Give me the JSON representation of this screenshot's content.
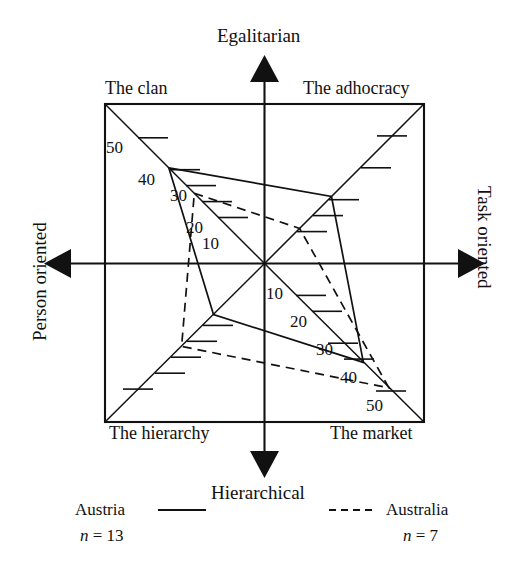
{
  "chart_data": {
    "type": "line",
    "title": "",
    "subtitle": "",
    "grid": false,
    "legend_position": "bottom",
    "axes": {
      "vertical": {
        "top_label": "Egalitarian",
        "bottom_label": "Hierarchical"
      },
      "horizontal": {
        "left_label": "Person oriented",
        "right_label": "Task oriented"
      }
    },
    "quadrants": [
      {
        "key": "clan",
        "label": "The clan",
        "corner": "top-left"
      },
      {
        "key": "adhocracy",
        "label": "The adhocracy",
        "corner": "top-right"
      },
      {
        "key": "hierarchy",
        "label": "The hierarchy",
        "corner": "bottom-left"
      },
      {
        "key": "market",
        "label": "The market",
        "corner": "bottom-right"
      }
    ],
    "scales": [
      {
        "key": "clan",
        "ticks": [
          10,
          20,
          30,
          40,
          50
        ],
        "tick_labels": [
          "10",
          "20",
          "30",
          "40",
          "50"
        ],
        "labeled": true
      },
      {
        "key": "adhocracy",
        "ticks": [
          10,
          20,
          30,
          40,
          50
        ],
        "tick_labels": [
          "",
          "",
          "",
          "",
          ""
        ],
        "labeled": false
      },
      {
        "key": "hierarchy",
        "ticks": [
          10,
          20,
          30,
          40,
          50
        ],
        "tick_labels": [
          "",
          "",
          "",
          "",
          ""
        ],
        "labeled": false
      },
      {
        "key": "market",
        "ticks": [
          10,
          20,
          30,
          40,
          50
        ],
        "tick_labels": [
          "10",
          "20",
          "30",
          "40",
          "50"
        ],
        "labeled": true
      }
    ],
    "scale_min": 0,
    "scale_max": 50,
    "categories": [
      "clan",
      "adhocracy",
      "market",
      "hierarchy"
    ],
    "series": [
      {
        "name": "Austria",
        "n": 13,
        "n_label": "n = 13",
        "line_style": "solid",
        "color": "#111111",
        "values": [
          30,
          21,
          31,
          16
        ]
      },
      {
        "name": "Australia",
        "n": 7,
        "n_label": "n = 7",
        "line_style": "dashed",
        "color": "#111111",
        "values": [
          22,
          11,
          39,
          26
        ]
      }
    ]
  },
  "labels": {
    "top_axis": "Egalitarian",
    "bottom_axis": "Hierarchical",
    "left_axis": "Person oriented",
    "right_axis": "Task oriented",
    "clan": "The clan",
    "adhocracy": "The adhocracy",
    "hierarchy": "The hierarchy",
    "market": "The market"
  },
  "tick_labels": {
    "clan": [
      "50",
      "40",
      "30",
      "20",
      "10"
    ],
    "market": [
      "10",
      "20",
      "30",
      "40",
      "50"
    ]
  },
  "legend": {
    "left": {
      "name": "Austria",
      "n_prefix": "n",
      "n_eq": "= 13"
    },
    "right": {
      "name": "Australia",
      "n_prefix": "n",
      "n_eq": "= 7"
    }
  }
}
